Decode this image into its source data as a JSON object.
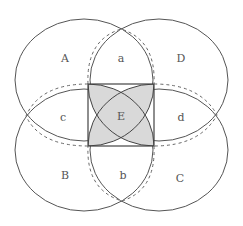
{
  "diagram": {
    "type": "geometric-region-diagram",
    "colors": {
      "stroke": "#555555",
      "dashed_stroke": "#666666",
      "shade": "#d9d9d9",
      "label": "#555555"
    },
    "regions": {
      "A": "A",
      "a": "a",
      "D": "D",
      "c": "c",
      "E": "E",
      "d": "d",
      "B": "B",
      "b": "b",
      "C": "C"
    }
  }
}
